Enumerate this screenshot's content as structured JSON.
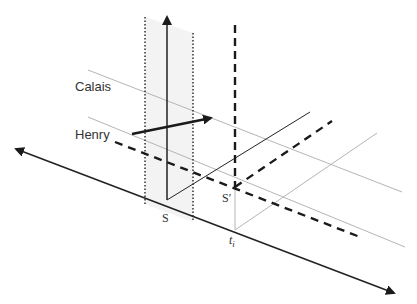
{
  "diagram": {
    "labels": {
      "calais": "Calais",
      "henry": "Henry",
      "s": "S",
      "s_prime": "S′",
      "t_i": "t",
      "t_i_sub": "i"
    },
    "colors": {
      "axis": "#222222",
      "grey_line": "#b5b5b5",
      "shade": "#f2f2f2",
      "dashed": "#1a1a1a",
      "text": "#333333"
    },
    "elements": [
      {
        "id": "time-axis",
        "type": "double-arrow",
        "style": "solid-dark"
      },
      {
        "id": "vertical-axis-at-s",
        "type": "arrow-up",
        "style": "solid-dark"
      },
      {
        "id": "world-band",
        "type": "shaded-region",
        "style": "dotted-boundaries"
      },
      {
        "id": "calais-worldline",
        "type": "line",
        "style": "solid-grey"
      },
      {
        "id": "henry-worldline",
        "type": "line",
        "style": "solid-grey"
      },
      {
        "id": "henry-to-calais-arrow",
        "type": "arrow",
        "style": "solid-bold"
      },
      {
        "id": "dashed-worldline",
        "type": "line",
        "style": "dashed-bold"
      },
      {
        "id": "s-prime-vertical",
        "type": "line",
        "style": "dashed-bold"
      },
      {
        "id": "s-diagonal",
        "type": "line",
        "style": "solid-dark"
      },
      {
        "id": "s-prime-diagonal",
        "type": "line",
        "style": "dashed-bold"
      },
      {
        "id": "ti-diagonal",
        "type": "line",
        "style": "solid-grey"
      },
      {
        "id": "ti-vertical",
        "type": "line",
        "style": "solid-grey"
      }
    ]
  }
}
